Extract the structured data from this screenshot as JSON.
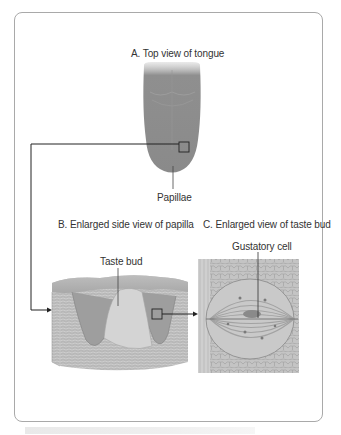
{
  "figure": {
    "panels": [
      {
        "id": "A",
        "title": "A. Top view of tongue",
        "callout": "Papillae"
      },
      {
        "id": "B",
        "title": "B. Enlarged side view of papilla",
        "callout": "Taste bud"
      },
      {
        "id": "C",
        "title": "C. Enlarged view of taste bud",
        "callout": "Gustatory cell"
      }
    ],
    "colors": {
      "frame_border": "#a9a9a9",
      "tongue": "#8e8e8e",
      "tissue": "#b5b5b5",
      "connector": "#222222",
      "text": "#333333"
    }
  }
}
